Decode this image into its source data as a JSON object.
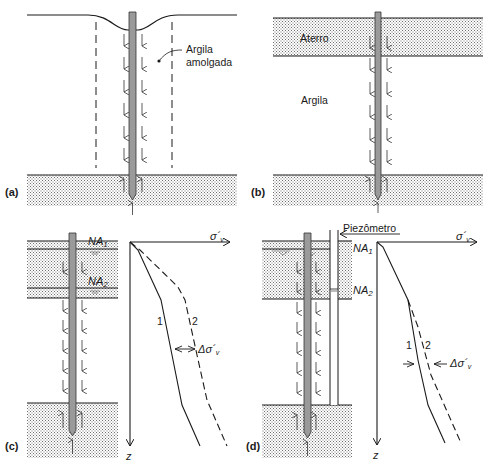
{
  "figure": {
    "panels": [
      {
        "id": "a",
        "label": "(a)",
        "annotation": "Argila\namolgada",
        "annotation_line1": "Argila",
        "annotation_line2": "amolgada"
      },
      {
        "id": "b",
        "label": "(b)",
        "layer_top": "Aterro",
        "layer_mid": "Argila"
      },
      {
        "id": "c",
        "label": "(c)",
        "water_level_1": "NA",
        "water_level_1_sub": "1",
        "water_level_2": "NA",
        "water_level_2_sub": "2",
        "axis_x": "σ´v",
        "axis_x_main": "σ´",
        "axis_x_sub": "v",
        "axis_z": "z",
        "curve_1": "1",
        "curve_2": "2",
        "delta": "Δσ´",
        "delta_sub": "v"
      },
      {
        "id": "d",
        "label": "(d)",
        "piezometer": "Piezômetro",
        "water_level_1": "NA",
        "water_level_1_sub": "1",
        "water_level_2": "NA",
        "water_level_2_sub": "2",
        "axis_x_main": "σ´",
        "axis_x_sub": "v",
        "axis_z": "z",
        "curve_1": "1",
        "curve_2": "2",
        "delta": "Δσ´",
        "delta_sub": "v"
      }
    ],
    "colors": {
      "line": "#1a1a1a",
      "pile": "#9a9a9a",
      "stipple": "#7a7a7a",
      "background": "#ffffff"
    }
  }
}
